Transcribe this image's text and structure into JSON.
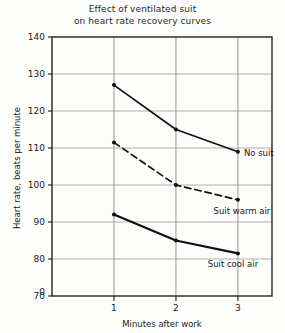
{
  "chart_data": {
    "type": "line",
    "title": "Effect of ventilated suit on heart rate recovery curves",
    "title_line1": "Effect of ventilated suit",
    "title_line2": "on heart rate recovery curves",
    "xlabel": "Minutes after work",
    "ylabel": "Heart rate, beats per minute",
    "x": [
      1,
      2,
      3
    ],
    "xlim": [
      0,
      3.55
    ],
    "ylim": [
      70,
      140
    ],
    "xticks": [
      1,
      2,
      3
    ],
    "xtick_labels": [
      "1",
      "2",
      "3"
    ],
    "yticks": [
      70,
      80,
      90,
      100,
      110,
      120,
      130,
      140
    ],
    "ytick_labels": [
      "70",
      "80",
      "90",
      "100",
      "110",
      "120",
      "130",
      "140"
    ],
    "origin_label": "0",
    "grid": true,
    "legend_position": "inline-annotations",
    "series": [
      {
        "name": "No suit",
        "values": [
          127,
          115,
          109
        ],
        "style": "solid",
        "color": "#101010",
        "annotation": "No suit"
      },
      {
        "name": "Suit warm air",
        "values": [
          111.5,
          100,
          96
        ],
        "style": "dashed",
        "color": "#101010",
        "annotation": "Suit warm air"
      },
      {
        "name": "Suit cool air",
        "values": [
          92,
          85,
          81.5
        ],
        "style": "solid",
        "color": "#101010",
        "annotation": "Suit cool air"
      }
    ],
    "annotations": [
      {
        "text": "No suit",
        "series": "No suit"
      },
      {
        "text": "Suit warm air",
        "series": "Suit warm air"
      },
      {
        "text": "Suit cool air",
        "series": "Suit cool air"
      }
    ],
    "colors": {
      "axis": "#1a1a1a",
      "grid": "#8c8c8c",
      "line": "#101010",
      "background": "#fdfdfb"
    }
  }
}
